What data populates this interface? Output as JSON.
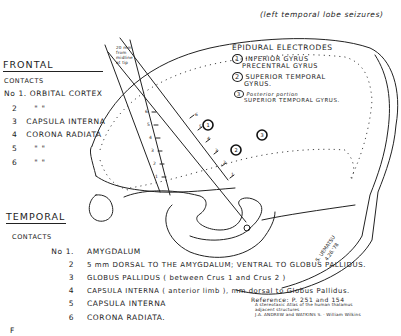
{
  "note_top_right": "(left temporal lobe seizures)",
  "frontal": {
    "title": "FRONTAL",
    "contacts_label": "CONTACTS",
    "contacts": [
      {
        "num": "No 1.",
        "text": "ORBITAL CORTEX"
      },
      {
        "num": "2",
        "text": "\"            \""
      },
      {
        "num": "3",
        "text": "CAPSULA INTERNA"
      },
      {
        "num": "4",
        "text": "CORONA RADIATA"
      },
      {
        "num": "5",
        "text": "\"            \""
      },
      {
        "num": "6",
        "text": "\"            \""
      }
    ]
  },
  "epidural": {
    "title": "EPIDURAL ELECTRODES",
    "items": [
      {
        "num": "1",
        "line1": "INFERIOR GYRUS",
        "line2": "PRECENTRAL GYRUS"
      },
      {
        "num": "2",
        "line1": "SUPERIOR TEMPORAL",
        "line2": "GYRUS."
      },
      {
        "num": "3",
        "line1": "Posterior portion",
        "line2": "SUPERIOR TEMPORAL GYRUS."
      }
    ]
  },
  "probe_note": [
    "20 mm",
    "from",
    "midline",
    "at tip"
  ],
  "electrode_markers": [
    "1",
    "2",
    "3"
  ],
  "frontal_probe_ticks": [
    "6",
    "5",
    "4",
    "3",
    "2",
    "1"
  ],
  "temporal_probe_ticks": [
    "6",
    "5",
    "4",
    "3",
    "2",
    "1"
  ],
  "signature": [
    "S. UEMATSU",
    "4.26.'78"
  ],
  "temporal": {
    "title": "TEMPORAL",
    "contacts_label": "CONTACTS",
    "contacts": [
      {
        "num": "No 1.",
        "text": "AMYGDALUM"
      },
      {
        "num": "2",
        "text": "5 mm DORSAL TO THE AMYGDALUM; VENTRAL TO GLOBUS PALLIDUS."
      },
      {
        "num": "3",
        "text": "GLOBUS PALLIDUS ( between Crus 1 and Crus 2 )"
      },
      {
        "num": "4",
        "text": "CAPSULA INTERNA ( anterior limb ), mm dorsal to Globus Pallidus."
      },
      {
        "num": "5",
        "text": "CAPSULA INTERNA"
      },
      {
        "num": "6",
        "text": "CORONA RADIATA."
      }
    ]
  },
  "reference": {
    "line1": "Reference: P. 251 and 154",
    "line2": "A stereotaxic Atlas of the human thalamus",
    "line3": "adjacent structures",
    "line4": "J.A. ANDREW and WATKINS S. · William Wilkins"
  },
  "corner_mark": "F"
}
